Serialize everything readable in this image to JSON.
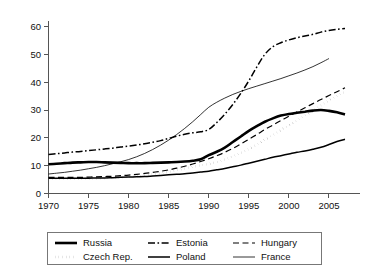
{
  "chart_data": {
    "type": "line",
    "title": "",
    "subtitle": "",
    "xlabel": "",
    "ylabel": "",
    "xlim": [
      1970,
      2008
    ],
    "ylim": [
      0,
      62
    ],
    "xticks": [
      1970,
      1975,
      1980,
      1985,
      1990,
      1995,
      2000,
      2005
    ],
    "yticks": [
      0,
      10,
      20,
      30,
      40,
      50,
      60
    ],
    "xtick_labels": [
      "1970",
      "1975",
      "1980",
      "1985",
      "1990",
      "1995",
      "2000",
      "2005"
    ],
    "ytick_labels": [
      "0",
      "10",
      "20",
      "30",
      "40",
      "50",
      "60"
    ],
    "grid": false,
    "legend_position": "below",
    "x": [
      1970,
      1971,
      1972,
      1973,
      1974,
      1975,
      1976,
      1977,
      1978,
      1979,
      1980,
      1981,
      1982,
      1983,
      1984,
      1985,
      1986,
      1987,
      1988,
      1989,
      1990,
      1991,
      1992,
      1993,
      1994,
      1995,
      1996,
      1997,
      1998,
      1999,
      2000,
      2001,
      2002,
      2003,
      2004,
      2005,
      2006,
      2007
    ],
    "series": [
      {
        "name": "Russia",
        "style": "solid-thick",
        "color": "#000000",
        "values": [
          10.5,
          10.7,
          10.9,
          11.1,
          11.2,
          11.3,
          11.3,
          11.2,
          11.1,
          11.0,
          10.9,
          10.9,
          10.9,
          11.0,
          11.1,
          11.2,
          11.3,
          11.5,
          11.8,
          12.3,
          13.8,
          15.0,
          16.5,
          18.5,
          20.5,
          22.5,
          24.2,
          25.8,
          27.0,
          28.0,
          28.6,
          29.0,
          29.4,
          29.8,
          30.0,
          29.7,
          29.2,
          28.4
        ]
      },
      {
        "name": "Estonia",
        "style": "dash-dot",
        "color": "#000000",
        "values": [
          14.0,
          14.3,
          14.6,
          14.9,
          15.1,
          15.4,
          15.7,
          16.0,
          16.3,
          16.7,
          17.0,
          17.4,
          17.9,
          18.4,
          19.0,
          19.8,
          20.6,
          21.3,
          21.8,
          22.2,
          23.0,
          25.5,
          28.5,
          32.0,
          36.0,
          40.5,
          45.5,
          50.0,
          52.8,
          54.2,
          55.2,
          56.0,
          56.6,
          57.2,
          58.0,
          58.6,
          59.0,
          59.3
        ]
      },
      {
        "name": "Hungary",
        "style": "dashed",
        "color": "#000000",
        "values": [
          5.8,
          5.8,
          5.8,
          5.8,
          5.8,
          5.9,
          6.0,
          6.1,
          6.2,
          6.4,
          6.6,
          6.9,
          7.2,
          7.6,
          8.0,
          8.5,
          9.1,
          9.8,
          10.6,
          11.5,
          12.5,
          13.6,
          14.8,
          16.2,
          17.8,
          19.5,
          21.2,
          23.0,
          24.6,
          26.2,
          27.8,
          29.3,
          30.8,
          32.3,
          33.8,
          35.2,
          36.6,
          38.0
        ]
      },
      {
        "name": "Czech Rep.",
        "style": "dotted-thick",
        "color": "#000000",
        "values": [
          5.2,
          5.2,
          5.2,
          5.3,
          5.3,
          5.4,
          5.4,
          5.5,
          5.6,
          5.8,
          6.0,
          6.2,
          6.5,
          6.9,
          7.3,
          7.8,
          8.4,
          9.0,
          9.6,
          10.1,
          10.6,
          11.3,
          12.2,
          13.3,
          14.6,
          16.0,
          17.6,
          19.3,
          21.0,
          22.8,
          24.5,
          26.2,
          28.0,
          29.8,
          31.6,
          33.4,
          35.1,
          36.5
        ]
      },
      {
        "name": "Poland",
        "style": "solid-medium",
        "color": "#000000",
        "values": [
          5.5,
          5.5,
          5.5,
          5.5,
          5.5,
          5.5,
          5.6,
          5.6,
          5.7,
          5.8,
          5.9,
          6.0,
          6.1,
          6.3,
          6.5,
          6.7,
          6.9,
          7.1,
          7.4,
          7.7,
          8.0,
          8.5,
          9.0,
          9.6,
          10.2,
          10.9,
          11.6,
          12.3,
          13.0,
          13.6,
          14.2,
          14.8,
          15.3,
          15.9,
          16.6,
          17.6,
          18.7,
          19.5
        ]
      },
      {
        "name": "France",
        "style": "solid-thin",
        "color": "#000000",
        "values": [
          7.0,
          7.3,
          7.6,
          8.0,
          8.4,
          8.9,
          9.4,
          10.0,
          10.7,
          11.4,
          12.2,
          13.2,
          14.4,
          15.8,
          17.4,
          19.2,
          21.2,
          23.4,
          25.8,
          28.4,
          31.0,
          32.8,
          34.3,
          35.6,
          36.7,
          37.7,
          38.6,
          39.5,
          40.4,
          41.3,
          42.3,
          43.3,
          44.4,
          45.6,
          47.0,
          48.5,
          null,
          null
        ]
      }
    ]
  },
  "legend": {
    "entries": [
      {
        "label": "Russia",
        "style": "solid-thick"
      },
      {
        "label": "Estonia",
        "style": "dash-dot"
      },
      {
        "label": "Hungary",
        "style": "dashed"
      },
      {
        "label": "Czech Rep.",
        "style": "dotted-thick"
      },
      {
        "label": "Poland",
        "style": "solid-medium"
      },
      {
        "label": "France",
        "style": "solid-thin"
      }
    ]
  }
}
